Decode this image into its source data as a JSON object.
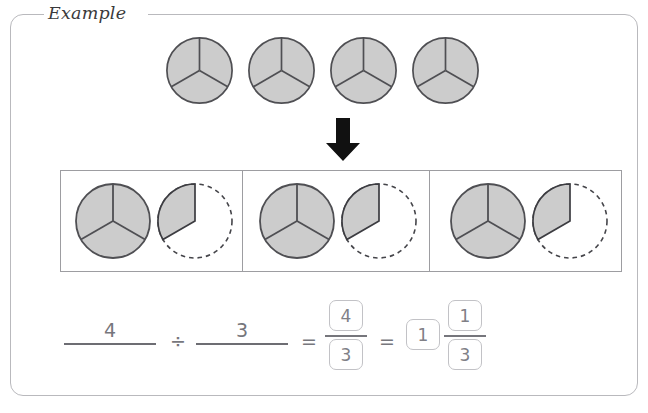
{
  "panel": {
    "legend_label": "Example",
    "border_color": "#b9b9bd"
  },
  "colors": {
    "pie_fill": "#cccccc",
    "pie_stroke": "#4f4f53",
    "dashed_stroke": "#45454a",
    "table_border": "#9d9da1",
    "arrow": "#111111",
    "pencil_gray": "#76767c",
    "box_border": "#c2c2c6"
  },
  "top_row": {
    "name": "whole-circles-row",
    "count": 4,
    "slices_per_circle": 3,
    "shaded_slices_per_circle": 3,
    "circles": [
      {
        "label": "whole-circle-1",
        "cx": 199,
        "cy": 70,
        "r": 33
      },
      {
        "label": "whole-circle-2",
        "cx": 281,
        "cy": 70,
        "r": 33
      },
      {
        "label": "whole-circle-3",
        "cx": 363,
        "cy": 70,
        "r": 33
      },
      {
        "label": "whole-circle-4",
        "cx": 445,
        "cy": 70,
        "r": 33
      }
    ]
  },
  "arrow": {
    "name": "down-arrow",
    "direction": "down"
  },
  "group_table": {
    "name": "grouping-table",
    "cells": [
      {
        "label": "group-cell-1",
        "whole_circle": {
          "slices": 3,
          "shaded": 3
        },
        "partial_circle": {
          "slices": 3,
          "shaded": 1,
          "outline": "dashed"
        }
      },
      {
        "label": "group-cell-2",
        "whole_circle": {
          "slices": 3,
          "shaded": 3
        },
        "partial_circle": {
          "slices": 3,
          "shaded": 1,
          "outline": "dashed"
        }
      },
      {
        "label": "group-cell-3",
        "whole_circle": {
          "slices": 3,
          "shaded": 3
        },
        "partial_circle": {
          "slices": 3,
          "shaded": 1,
          "outline": "dashed"
        }
      }
    ]
  },
  "equation": {
    "name": "division-equation",
    "dividend": "4",
    "divide_sign": "÷",
    "divisor": "3",
    "equals_sign_1": "=",
    "improper_fraction": {
      "numerator": "4",
      "denominator": "3"
    },
    "equals_sign_2": "=",
    "mixed_number": {
      "whole": "1",
      "numerator": "1",
      "denominator": "3"
    }
  }
}
